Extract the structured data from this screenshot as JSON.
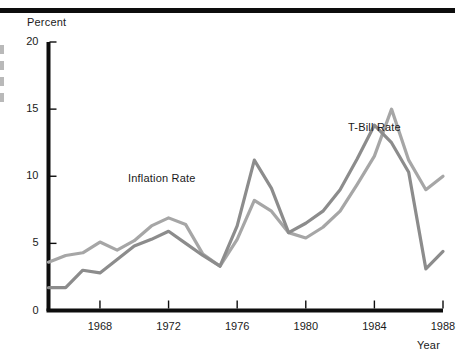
{
  "figure": {
    "top_rule": "horizontal-rule",
    "margin_marks": [
      "mark",
      "mark",
      "mark",
      "mark"
    ]
  },
  "chart_data": {
    "type": "line",
    "title": "",
    "xlabel": "Year",
    "ylabel": "Percent",
    "xlim": [
      1965,
      1988
    ],
    "ylim": [
      0,
      20
    ],
    "grid": false,
    "legend_position": "inline-annotations",
    "x": [
      1965,
      1966,
      1967,
      1968,
      1969,
      1970,
      1971,
      1972,
      1973,
      1974,
      1975,
      1976,
      1977,
      1978,
      1979,
      1980,
      1981,
      1982,
      1983,
      1984,
      1985,
      1986,
      1987,
      1988
    ],
    "yticks": [
      0,
      5,
      10,
      15,
      20
    ],
    "ytick_labels": [
      "0",
      "5",
      "10",
      "15",
      "20"
    ],
    "xticks": [
      1968,
      1972,
      1976,
      1980,
      1984,
      1988
    ],
    "xtick_labels": [
      "1968",
      "1972",
      "1976",
      "1980",
      "1984",
      "1988"
    ],
    "series": [
      {
        "name": "T-Bill Rate",
        "color": "#a6a6a6",
        "label_x": 1984.1,
        "label_y": 13.1,
        "values": [
          3.6,
          4.1,
          4.4,
          5.1,
          4.6,
          4.5,
          5.4,
          6.2,
          6.9,
          6.7,
          5.6,
          4.1,
          5.1,
          7.5,
          8.2,
          9.4,
          8.7,
          7.5,
          5.8,
          5.5,
          6.2,
          7.4,
          10.1,
          11.5
        ]
      },
      {
        "name": "Inflation Rate",
        "color": "#8c8c8c",
        "label_x": 1971.6,
        "label_y": 9.8,
        "values": [
          1.7,
          1.7,
          3.0,
          2.8,
          3.8,
          4.8,
          5.3,
          5.8,
          5.6,
          4.5,
          4.1,
          3.3,
          4.0,
          6.1,
          8.2,
          7.0,
          5.9,
          5.3,
          5.5,
          6.2,
          7.4,
          9.0,
          11.0,
          12.2
        ]
      }
    ],
    "annotations": [
      {
        "text": "Inflation Rate",
        "x_px": 128,
        "y_px": 172
      },
      {
        "text": "T-Bill Rate",
        "x_px": 348,
        "y_px": 121
      }
    ],
    "series_points": {
      "tbill": [
        [
          1965,
          3.6
        ],
        [
          1966,
          4.1
        ],
        [
          1967,
          4.3
        ],
        [
          1968,
          5.1
        ],
        [
          1969,
          4.5
        ],
        [
          1970,
          5.2
        ],
        [
          1971,
          6.3
        ],
        [
          1972,
          6.9
        ],
        [
          1973,
          6.4
        ],
        [
          1974,
          4.2
        ],
        [
          1975,
          3.3
        ],
        [
          1976,
          5.3
        ],
        [
          1977,
          8.2
        ],
        [
          1978,
          7.4
        ],
        [
          1979,
          5.8
        ],
        [
          1980,
          5.4
        ],
        [
          1981,
          6.2
        ],
        [
          1982,
          7.4
        ],
        [
          1983,
          9.4
        ],
        [
          1984,
          11.5
        ],
        [
          1985,
          15.0
        ],
        [
          1986,
          11.2
        ],
        [
          1987,
          9.0
        ],
        [
          1988,
          10.0
        ]
      ],
      "inflation": [
        [
          1965,
          1.7
        ],
        [
          1966,
          1.7
        ],
        [
          1967,
          3.0
        ],
        [
          1968,
          2.8
        ],
        [
          1969,
          3.8
        ],
        [
          1970,
          4.8
        ],
        [
          1971,
          5.3
        ],
        [
          1972,
          5.9
        ],
        [
          1973,
          5.0
        ],
        [
          1974,
          4.1
        ],
        [
          1975,
          3.3
        ],
        [
          1976,
          6.3
        ],
        [
          1977,
          11.2
        ],
        [
          1978,
          9.1
        ],
        [
          1979,
          5.8
        ],
        [
          1980,
          6.5
        ],
        [
          1981,
          7.4
        ],
        [
          1982,
          9.0
        ],
        [
          1983,
          11.3
        ],
        [
          1984,
          13.8
        ],
        [
          1985,
          12.5
        ],
        [
          1986,
          10.3
        ],
        [
          1987,
          3.1
        ],
        [
          1988,
          4.4
        ]
      ]
    }
  }
}
